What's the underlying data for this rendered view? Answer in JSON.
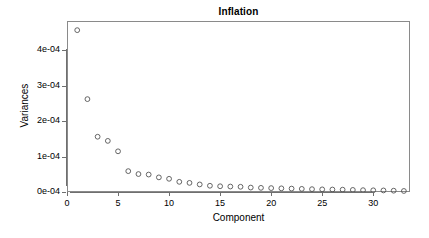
{
  "chart_data": {
    "type": "scatter",
    "title": "Inflation",
    "xlabel": "Component",
    "ylabel": "Variances",
    "grid": false,
    "legend": null,
    "point_style": "open-circle",
    "xlim": [
      0,
      33.6
    ],
    "ylim": [
      0,
      0.000482
    ],
    "xticks": [
      0,
      5,
      10,
      15,
      20,
      25,
      30
    ],
    "xticklabels": [
      "0",
      "5",
      "10",
      "15",
      "20",
      "25",
      "30"
    ],
    "yticks": [
      0.0,
      0.0001,
      0.0002,
      0.0003,
      0.0004
    ],
    "yticklabels": [
      "0e-04",
      "1e-04",
      "2e-04",
      "3e-04",
      "4e-04"
    ],
    "x": [
      1,
      2,
      3,
      4,
      5,
      6,
      7,
      8,
      9,
      10,
      11,
      12,
      13,
      14,
      15,
      16,
      17,
      18,
      19,
      20,
      21,
      22,
      23,
      24,
      25,
      26,
      27,
      28,
      29,
      30,
      31,
      32,
      33
    ],
    "values": [
      0.0004562,
      0.0002618,
      0.0001558,
      0.0001441,
      0.0001147,
      5.88e-05,
      5.06e-05,
      4.92e-05,
      4.12e-05,
      3.72e-05,
      2.87e-05,
      2.57e-05,
      2.13e-05,
      1.76e-05,
      1.62e-05,
      1.54e-05,
      1.47e-05,
      1.25e-05,
      1.17e-05,
      1.1e-05,
      1.03e-05,
      9.6e-06,
      8.8e-06,
      8e-06,
      7.4e-06,
      7e-06,
      6.6e-06,
      5.9e-06,
      5.2e-06,
      4.8e-06,
      4.4e-06,
      3.7e-06,
      2.9e-06
    ]
  },
  "style": {
    "point_color": "#555555",
    "axis_color": "#6f6f6f",
    "box_color": "#8a8a8a",
    "text_color": "#000000",
    "background": "#ffffff"
  }
}
